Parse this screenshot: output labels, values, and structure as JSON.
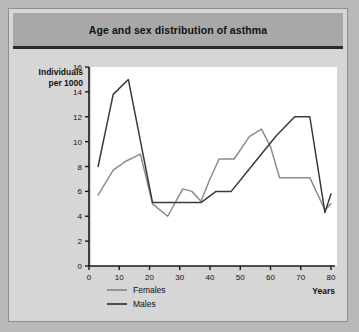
{
  "chart_data": {
    "type": "line",
    "title": "Age and sex distribution of asthma",
    "xlabel": "Years",
    "ylabel": "Individuals per 1000",
    "xlim": [
      0,
      80
    ],
    "ylim": [
      0,
      16
    ],
    "xticks": [
      0,
      10,
      20,
      30,
      40,
      50,
      60,
      70,
      80
    ],
    "yticks": [
      0,
      2,
      4,
      6,
      8,
      10,
      12,
      14,
      16
    ],
    "grid": false,
    "legend_position": "bottom-left",
    "series": [
      {
        "name": "Females",
        "color": "#8c8c8c",
        "points": [
          [
            3,
            5.7
          ],
          [
            8,
            7.7
          ],
          [
            12,
            8.4
          ],
          [
            17,
            9.0
          ],
          [
            21,
            5.0
          ],
          [
            26,
            4.0
          ],
          [
            31,
            6.2
          ],
          [
            34,
            6.0
          ],
          [
            37,
            5.2
          ],
          [
            40,
            7.0
          ],
          [
            43,
            8.6
          ],
          [
            48,
            8.6
          ],
          [
            53,
            10.4
          ],
          [
            57,
            11.0
          ],
          [
            60,
            9.6
          ],
          [
            63,
            7.1
          ],
          [
            68,
            7.1
          ],
          [
            73,
            7.1
          ],
          [
            78,
            4.5
          ],
          [
            80,
            5.0
          ]
        ]
      },
      {
        "name": "Males",
        "color": "#3a3a3a",
        "points": [
          [
            3,
            8.0
          ],
          [
            8,
            13.8
          ],
          [
            13,
            15.0
          ],
          [
            21,
            5.1
          ],
          [
            26,
            5.1
          ],
          [
            31,
            5.1
          ],
          [
            37,
            5.1
          ],
          [
            42,
            6.0
          ],
          [
            47,
            6.0
          ],
          [
            52,
            7.5
          ],
          [
            57,
            9.0
          ],
          [
            62,
            10.5
          ],
          [
            68,
            12.0
          ],
          [
            73,
            12.0
          ],
          [
            78,
            4.3
          ],
          [
            80,
            5.8
          ]
        ]
      }
    ]
  },
  "legend": [
    {
      "label": "Females"
    },
    {
      "label": "Males"
    }
  ]
}
